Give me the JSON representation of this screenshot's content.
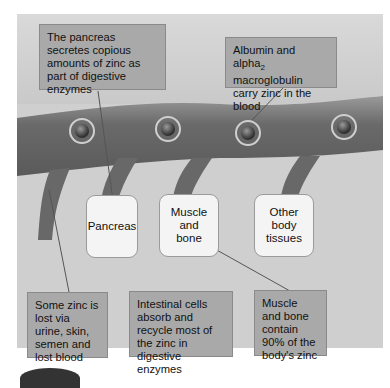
{
  "diagram": {
    "callouts": {
      "pancreas_secretes": "The pancreas secretes copious amounts of zinc as part of digestive enzymes",
      "albumin_prefix": "Albumin and alpha",
      "albumin_subscript": "2",
      "albumin_suffix": " macroglobulin carry zinc in the blood",
      "lost_zinc": "Some zinc is lost via urine, skin, semen and lost blood",
      "intestinal_cells": "Intestinal cells absorb and recycle most of the zinc in digestive enzymes",
      "muscle_bone_contain": "Muscle and bone contain 90% of the body's zinc"
    },
    "organs": [
      {
        "label": "Pancreas"
      },
      {
        "label": "Muscle\nand\nbone"
      },
      {
        "label": "Other\nbody\ntissues"
      }
    ],
    "colors": {
      "background": "#cfcfcf",
      "callout_fill": "#a9a9a9",
      "organ_fill": "#f4f4f4",
      "vessel": "#6e6e6e"
    }
  }
}
